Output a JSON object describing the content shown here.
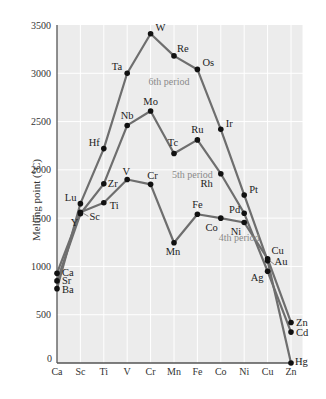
{
  "chart_data": {
    "type": "line",
    "title": "",
    "xlabel": "",
    "ylabel": "Melting point (°C)",
    "ylim": [
      0,
      3500
    ],
    "yticks": [
      0,
      500,
      1000,
      1500,
      2000,
      2500,
      3000,
      3500
    ],
    "grid": true,
    "categories": [
      "Ca",
      "Sc",
      "Ti",
      "V",
      "Cr",
      "Mn",
      "Fe",
      "Co",
      "Ni",
      "Cu",
      "Zn"
    ],
    "colors": {
      "line": "#6e6e6e",
      "marker": "#111111",
      "background": "#ececec",
      "grid": "#ffffff",
      "period_label": "#8a8a8a"
    },
    "series": [
      {
        "name": "4th period",
        "elements": [
          "Ca",
          "Sc",
          "Ti",
          "V",
          "Cr",
          "Mn",
          "Fe",
          "Co",
          "Ni",
          "Cu",
          "Zn"
        ],
        "values": [
          930,
          1560,
          1660,
          1900,
          1850,
          1245,
          1540,
          1500,
          1455,
          1080,
          420
        ]
      },
      {
        "name": "5th period",
        "elements": [
          "Sr",
          "Y",
          "Zr",
          "Nb",
          "Mo",
          "Tc",
          "Ru",
          "Rh",
          "Pd",
          "Ag",
          "Cd"
        ],
        "values": [
          850,
          1545,
          1855,
          2460,
          2610,
          2170,
          2310,
          1960,
          1550,
          950,
          320
        ]
      },
      {
        "name": "6th period",
        "elements": [
          "Ba",
          "Lu",
          "Hf",
          "Ta",
          "W",
          "Re",
          "Os",
          "Ir",
          "Pt",
          "Au",
          "Hg"
        ],
        "values": [
          770,
          1650,
          2220,
          3000,
          3410,
          3180,
          3040,
          2420,
          1740,
          1060,
          0
        ]
      }
    ],
    "period_labels": [
      {
        "text": "6th period",
        "x": "Cr",
        "y": 2880
      },
      {
        "text": "5th period",
        "x": "Mn",
        "y": 1920
      },
      {
        "text": "4th period",
        "x": "Co",
        "y": 1265
      }
    ]
  }
}
